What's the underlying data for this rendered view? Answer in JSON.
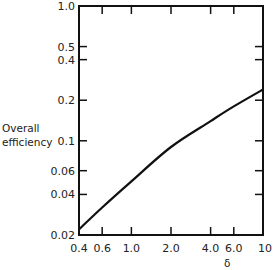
{
  "chart_data": {
    "type": "line",
    "title": "",
    "xlabel": "δ",
    "ylabel": "Overall efficiency",
    "xscale": "log",
    "yscale": "log",
    "xlim": [
      0.4,
      10
    ],
    "ylim": [
      0.02,
      1.0
    ],
    "grid": false,
    "x_ticks": [
      "0.4",
      "0.6",
      "1.0",
      "2.0",
      "4.0",
      "6.0",
      "10"
    ],
    "y_ticks": [
      "0.02",
      "0.04",
      "0.06",
      "0.1",
      "0.2",
      "0.4",
      "0.5",
      "1.0"
    ],
    "series": [
      {
        "name": "Overall efficiency",
        "x": [
          0.4,
          0.6,
          1.0,
          2.0,
          4.0,
          6.0,
          10
        ],
        "values": [
          0.022,
          0.032,
          0.05,
          0.09,
          0.14,
          0.18,
          0.24
        ]
      }
    ]
  },
  "labels": {
    "ylabel_line1": "Overall",
    "ylabel_line2": "efficiency",
    "xlabel": "δ"
  }
}
